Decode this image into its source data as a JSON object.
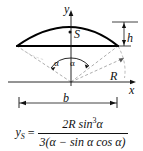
{
  "figure": {
    "axis_labels": {
      "x": "x",
      "y": "y"
    },
    "point_labels": {
      "centroid": "S"
    },
    "dimension_labels": {
      "height": "h",
      "radius": "R",
      "chord": "b",
      "half_angle_left": "α",
      "half_angle_right": "α"
    },
    "colors": {
      "segment_outline": "#000000",
      "axis": "#111111",
      "construction_dashed": "#888888",
      "background": "#ffffff"
    }
  },
  "formula": {
    "lhs_variable": "y",
    "lhs_subscript": "S",
    "equals": "=",
    "numerator": "2R sin",
    "numerator_exponent": "3",
    "numerator_tail": "α",
    "denominator_open": "3(α − sin α cos α)",
    "full_text": "y_S = 2R sin^3 α / (3(α − sin α cos α))"
  }
}
